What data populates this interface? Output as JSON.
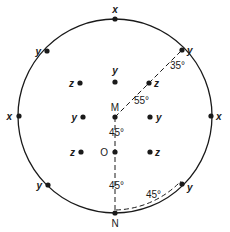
{
  "figure": {
    "type": "stereographic-projection",
    "circle": {
      "cx": 115,
      "cy": 116,
      "r": 97
    },
    "colors": {
      "ink": "#1a1a1a",
      "background": "#ffffff"
    },
    "points": [
      {
        "id": "x-top",
        "label": "x",
        "x": 115,
        "y": 19,
        "lx": 115,
        "ly": 13,
        "anchor": "middle"
      },
      {
        "id": "x-left",
        "label": "x",
        "x": 19,
        "y": 116,
        "lx": 12,
        "ly": 120,
        "anchor": "end"
      },
      {
        "id": "x-right",
        "label": "x",
        "x": 211,
        "y": 116,
        "lx": 216,
        "ly": 120,
        "anchor": "start"
      },
      {
        "id": "y-top-left",
        "label": "y",
        "x": 47,
        "y": 51,
        "lx": 41,
        "ly": 55,
        "anchor": "end"
      },
      {
        "id": "y-top-right",
        "label": "y",
        "x": 182,
        "y": 50,
        "lx": 187,
        "ly": 54,
        "anchor": "start"
      },
      {
        "id": "y-bottom-left",
        "label": "y",
        "x": 48,
        "y": 185,
        "lx": 42,
        "ly": 189,
        "anchor": "end"
      },
      {
        "id": "y-bottom-right",
        "label": "y",
        "x": 182,
        "y": 184,
        "lx": 187,
        "ly": 191,
        "anchor": "start"
      },
      {
        "id": "z-upper-left",
        "label": "z",
        "x": 80,
        "y": 83,
        "lx": 74,
        "ly": 87,
        "anchor": "end"
      },
      {
        "id": "y-upper-center",
        "label": "y",
        "x": 115,
        "y": 82,
        "lx": 115,
        "ly": 74,
        "anchor": "middle"
      },
      {
        "id": "z-upper-right",
        "label": "z",
        "x": 149,
        "y": 83,
        "lx": 154,
        "ly": 87,
        "anchor": "start"
      },
      {
        "id": "y-mid-left",
        "label": "y",
        "x": 83,
        "y": 117,
        "lx": 77,
        "ly": 121,
        "anchor": "end"
      },
      {
        "id": "y-mid-right",
        "label": "y",
        "x": 150,
        "y": 117,
        "lx": 156,
        "ly": 121,
        "anchor": "start"
      },
      {
        "id": "z-lower-left",
        "label": "z",
        "x": 81,
        "y": 152,
        "lx": 75,
        "ly": 156,
        "anchor": "end"
      },
      {
        "id": "z-lower-right",
        "label": "z",
        "x": 150,
        "y": 152,
        "lx": 155,
        "ly": 156,
        "anchor": "start"
      }
    ],
    "named_points": [
      {
        "id": "M",
        "label": "M",
        "x": 115,
        "y": 117,
        "lx": 115,
        "ly": 111,
        "anchor": "middle"
      },
      {
        "id": "O",
        "label": "O",
        "x": 115,
        "y": 152,
        "lx": 108,
        "ly": 156,
        "anchor": "end"
      },
      {
        "id": "N",
        "label": "N",
        "x": 115,
        "y": 213,
        "lx": 115,
        "ly": 227,
        "anchor": "middle"
      }
    ],
    "angles": [
      {
        "id": "angle-35",
        "text": "35°",
        "x": 170,
        "y": 69
      },
      {
        "id": "angle-55",
        "text": "55°",
        "x": 134,
        "y": 104
      },
      {
        "id": "angle-45-upper",
        "text": "45°",
        "x": 109,
        "y": 136
      },
      {
        "id": "angle-45-lower",
        "text": "45°",
        "x": 109,
        "y": 189
      },
      {
        "id": "angle-45-arc",
        "text": "45°",
        "x": 146,
        "y": 198
      }
    ],
    "dashed_lines": [
      {
        "id": "line-M-to-y-top-right",
        "x1": 115,
        "y1": 117,
        "x2": 182,
        "y2": 50
      },
      {
        "id": "line-M-to-N",
        "x1": 115,
        "y1": 117,
        "x2": 115,
        "y2": 213
      }
    ],
    "dashed_arc": {
      "id": "arc-N-to-y-bottom-right",
      "d": "M 116 210 A 94 94 0 0 0 181 181"
    }
  }
}
